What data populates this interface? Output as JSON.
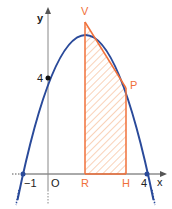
{
  "figure": {
    "axis_labels": {
      "x": "x",
      "y": "y"
    },
    "origin_label": "O",
    "tick_labels": {
      "neg_one": "−1",
      "four_x": "4",
      "four_y": "4"
    },
    "points": {
      "V": {
        "label": "V",
        "x": 1.5,
        "y": 6.25
      },
      "P": {
        "label": "P",
        "x": 3,
        "y": 4
      },
      "R": {
        "label": "R",
        "x": 1.5,
        "y": 0
      },
      "H": {
        "label": "H",
        "x": 3,
        "y": 0
      }
    },
    "parabola": "y = -(x+1)(x-4)",
    "roots": [
      -1,
      4
    ],
    "y_intercept": 4,
    "colors": {
      "curve": "#2a4a9a",
      "shape": "#f0703a",
      "hatch": "#f5b48a",
      "axis": "#555555",
      "labels_orange": "#f0703a"
    }
  }
}
